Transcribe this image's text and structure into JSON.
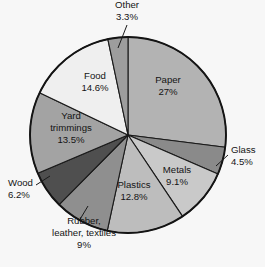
{
  "chart_data": {
    "type": "pie",
    "title": "",
    "subtitle": "",
    "xlabel": "",
    "ylabel": "",
    "legend_position": "none",
    "grid": false,
    "units": "percent",
    "start_angle_deg": 0,
    "direction": "clockwise",
    "categories": [
      "Paper",
      "Glass",
      "Metals",
      "Plastics",
      "Rubber, leather, textiles",
      "Wood",
      "Yard trimmings",
      "Food",
      "Other"
    ],
    "values": [
      27,
      4.5,
      9.1,
      12.8,
      9,
      6.2,
      13.5,
      14.6,
      3.3
    ],
    "slices": [
      {
        "key": "paper",
        "name": "Paper",
        "value": 27,
        "value_label": "27%",
        "name_lines": [
          "Paper"
        ],
        "color": "#b3b3b3",
        "label_placement": "inside",
        "label_x": 168,
        "label_y": 86,
        "leader": false
      },
      {
        "key": "glass",
        "name": "Glass",
        "value": 4.5,
        "value_label": "4.5%",
        "name_lines": [
          "Glass"
        ],
        "color": "#8a8a8a",
        "label_placement": "outside-right",
        "label_x": 231,
        "label_y": 156,
        "leader": true,
        "leader_from_x": 216,
        "leader_from_y": 166,
        "leader_to_x": 228,
        "leader_to_y": 155
      },
      {
        "key": "metals",
        "name": "Metals",
        "value": 9.1,
        "value_label": "9.1%",
        "name_lines": [
          "Metals"
        ],
        "color": "#c9c9c9",
        "label_placement": "inside",
        "label_x": 177,
        "label_y": 176,
        "leader": false
      },
      {
        "key": "plastics",
        "name": "Plastics",
        "value": 12.8,
        "value_label": "12.8%",
        "name_lines": [
          "Plastics"
        ],
        "color": "#bdbdbd",
        "label_placement": "inside",
        "label_x": 134,
        "label_y": 191,
        "leader": false
      },
      {
        "key": "rubber_leather_textiles",
        "name": "Rubber, leather, textiles",
        "value": 9,
        "value_label": "9%",
        "name_lines": [
          "Rubber,",
          "leather, textiles"
        ],
        "color": "#8f8f8f",
        "label_placement": "outside-bottom",
        "label_x": 84,
        "label_y": 233,
        "leader": true,
        "leader_from_x": 79,
        "leader_from_y": 221,
        "leader_to_x": 88,
        "leader_to_y": 206
      },
      {
        "key": "wood",
        "name": "Wood",
        "value": 6.2,
        "value_label": "6.2%",
        "name_lines": [
          "Wood"
        ],
        "color": "#4f4f4f",
        "label_placement": "outside-left",
        "label_x": 8,
        "label_y": 189,
        "leader": true,
        "leader_from_x": 36,
        "leader_from_y": 185,
        "leader_to_x": 50,
        "leader_to_y": 176
      },
      {
        "key": "yard_trimmings",
        "name": "Yard trimmings",
        "value": 13.5,
        "value_label": "13.5%",
        "name_lines": [
          "Yard",
          "trimmings"
        ],
        "color": "#a3a3a3",
        "label_placement": "inside",
        "label_x": 71,
        "label_y": 128,
        "leader": false
      },
      {
        "key": "food",
        "name": "Food",
        "value": 14.6,
        "value_label": "14.6%",
        "name_lines": [
          "Food"
        ],
        "color": "#efefef",
        "label_placement": "inside",
        "label_x": 95,
        "label_y": 82,
        "leader": false
      },
      {
        "key": "other",
        "name": "Other",
        "value": 3.3,
        "value_label": "3.3%",
        "name_lines": [
          "Other"
        ],
        "color": "#9d9d9d",
        "label_placement": "outside-top",
        "label_x": 127,
        "label_y": 11,
        "leader": true,
        "leader_from_x": 127,
        "leader_from_y": 25,
        "leader_to_x": 118,
        "leader_to_y": 48
      }
    ],
    "geometry": {
      "center_x": 128,
      "center_y": 135,
      "radius": 98
    },
    "background_color": "#f7f7f7",
    "outline_color": "#141414"
  }
}
